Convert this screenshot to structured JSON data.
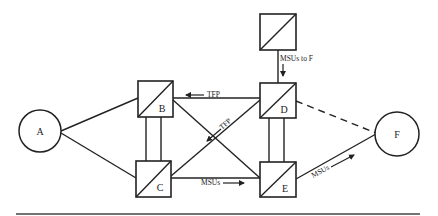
{
  "diagram": {
    "type": "network-topology",
    "nodes": {
      "A": {
        "label": "A",
        "shape": "circle"
      },
      "B": {
        "label": "B",
        "shape": "box-diagonal"
      },
      "C": {
        "label": "C",
        "shape": "box-diagonal"
      },
      "D": {
        "label": "D",
        "shape": "box-diagonal"
      },
      "E": {
        "label": "E",
        "shape": "box-diagonal"
      },
      "F": {
        "label": "F",
        "shape": "circle"
      },
      "T": {
        "label": "",
        "shape": "box-diagonal"
      }
    },
    "edges": [
      {
        "from": "A",
        "to": "B",
        "style": "solid"
      },
      {
        "from": "A",
        "to": "C",
        "style": "solid"
      },
      {
        "from": "B",
        "to": "C",
        "style": "double"
      },
      {
        "from": "D",
        "to": "E",
        "style": "double"
      },
      {
        "from": "B",
        "to": "D",
        "style": "solid"
      },
      {
        "from": "C",
        "to": "E",
        "style": "solid"
      },
      {
        "from": "B",
        "to": "E",
        "style": "solid"
      },
      {
        "from": "C",
        "to": "D",
        "style": "solid"
      },
      {
        "from": "T",
        "to": "D",
        "style": "solid"
      },
      {
        "from": "D",
        "to": "F",
        "style": "dashed"
      },
      {
        "from": "E",
        "to": "F",
        "style": "solid"
      }
    ],
    "annotations": {
      "tfp_top": "TFP",
      "tfp_diag": "TFP",
      "msus_bottom": "MSUs",
      "msus_to_f": "MSUs to F",
      "msus_ef": "MSUs"
    }
  }
}
